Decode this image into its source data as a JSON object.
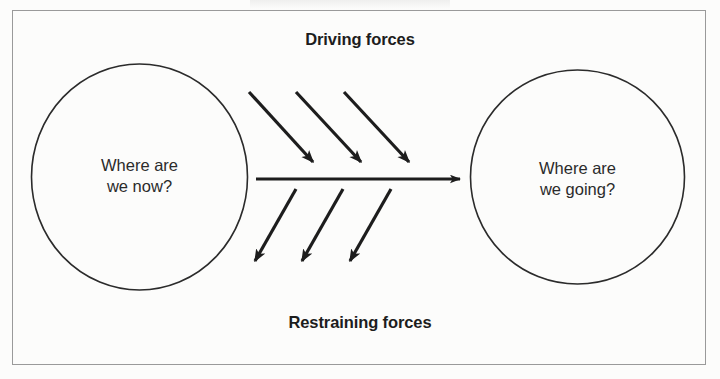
{
  "diagram": {
    "title_cutoff_remnant": "",
    "frame": {
      "border_color": "#9a9a9a",
      "background_color": "#fcfcfb"
    },
    "labels": {
      "top": "Driving forces",
      "bottom": "Restraining forces",
      "text_color": "#1d1d1d"
    },
    "nodes": [
      {
        "id": "current-state",
        "shape": "ellipse",
        "text": "Where are\nwe now?",
        "cx": 139.5,
        "cy": 177,
        "rx": 108,
        "ry": 113,
        "stroke": "#2b2b2b"
      },
      {
        "id": "future-state",
        "shape": "ellipse",
        "text": "Where are\nwe going?",
        "cx": 577.5,
        "cy": 177,
        "rx": 107,
        "ry": 107,
        "stroke": "#2b2b2b"
      }
    ],
    "center_arrow": {
      "name": "status-quo-arrow",
      "x1": 256,
      "y1": 179,
      "x2": 468,
      "y2": 179,
      "stroke": "#1d1d1d"
    },
    "driving_arrows": [
      {
        "x1": 249,
        "y1": 92,
        "x2": 320,
        "y2": 170
      },
      {
        "x1": 296,
        "y1": 92,
        "x2": 368,
        "y2": 170
      },
      {
        "x1": 344,
        "y1": 92,
        "x2": 416,
        "y2": 170
      }
    ],
    "restraining_arrows": [
      {
        "x1": 296,
        "y1": 189,
        "x2": 248,
        "y2": 270
      },
      {
        "x1": 343,
        "y1": 189,
        "x2": 295,
        "y2": 270
      },
      {
        "x1": 391,
        "y1": 189,
        "x2": 343,
        "y2": 270
      }
    ],
    "arrow_counts": {
      "driving": 3,
      "restraining": 3
    }
  }
}
